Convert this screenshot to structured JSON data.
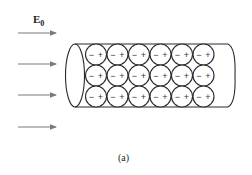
{
  "field_label": {
    "main": "E",
    "sub": "0"
  },
  "caption": "(a)",
  "arrows": [
    {
      "y": 33
    },
    {
      "y": 64
    },
    {
      "y": 95
    },
    {
      "y": 127
    }
  ],
  "dipole": {
    "minus": "−",
    "plus": "+"
  },
  "grid": {
    "rows": 3,
    "cols": 6
  },
  "colors": {
    "arrow": "#7a7a7a",
    "outline": "#2a2a2a",
    "text": "#222222"
  }
}
